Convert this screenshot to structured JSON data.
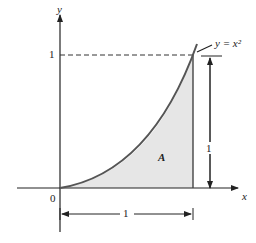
{
  "diagram": {
    "axis_x_label": "x",
    "axis_y_label": "y",
    "origin_label": "0",
    "y_tick_label": "1",
    "curve_label": "y = x²",
    "area_label": "A",
    "height_dimension_label": "1",
    "width_dimension_label": "1",
    "colors": {
      "line": "#333333",
      "curve": "#555555",
      "fill": "#e6e6e6"
    }
  }
}
